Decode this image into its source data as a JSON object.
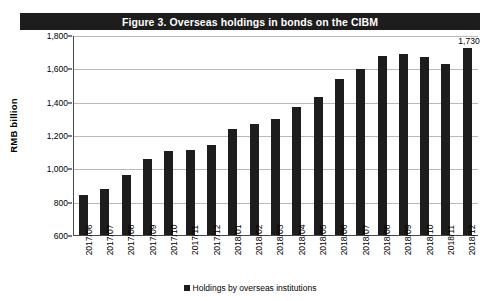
{
  "title": "Figure 3.  Overseas holdings in bonds on the CIBM",
  "axis": {
    "ylabel": "RMB  billion",
    "yticks": [
      "1,800",
      "1,600",
      "1,400",
      "1,200",
      "1,000",
      "800",
      "600"
    ]
  },
  "legend": {
    "marker": "square-marker",
    "label": "Holdings by overseas institutions"
  },
  "colors": {
    "bar": "#1d1d1d",
    "title_bar": "#1d1d1d",
    "title_text": "#ffffff",
    "gridline": "#b9b9b9",
    "axis_line": "#4a4a4a"
  },
  "chart_data": {
    "type": "bar",
    "title": "Figure 3.  Overseas holdings in bonds on the CIBM",
    "xlabel": "",
    "ylabel": "RMB  billion",
    "ylim": [
      600,
      1800
    ],
    "ytick_values": [
      600,
      800,
      1000,
      1200,
      1400,
      1600,
      1800
    ],
    "grid": true,
    "legend_position": "bottom-center",
    "categories": [
      "2017/06",
      "2017/07",
      "2017/08",
      "2017/09",
      "2017/10",
      "2017/11",
      "2017/12",
      "2018/01",
      "2018/02",
      "2018/03",
      "2018/04",
      "2018/05",
      "2018/06",
      "2018/07",
      "2018/08",
      "2018/09",
      "2018/10",
      "2018/11",
      "2018/12"
    ],
    "series": [
      {
        "name": "Holdings by overseas institutions",
        "values": [
          845,
          880,
          965,
          1060,
          1110,
          1115,
          1145,
          1245,
          1275,
          1300,
          1375,
          1435,
          1540,
          1605,
          1680,
          1690,
          1675,
          1635,
          1730
        ]
      }
    ],
    "annotations": [
      {
        "category": "2018/12",
        "value": 1730,
        "text": "1,730"
      }
    ]
  }
}
